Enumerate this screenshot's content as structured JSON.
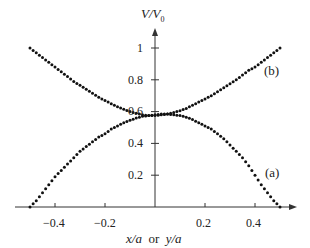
{
  "chart_data": {
    "type": "scatter",
    "title": "",
    "xlabel": "x/a  or  y/a",
    "ylabel": "V/V0",
    "xlim": [
      -0.5,
      0.5
    ],
    "ylim": [
      0,
      1.05
    ],
    "grid": false,
    "legend": "inline labels (a) and (b)",
    "x_ticks": [
      "-0.4",
      "-0.2",
      "0.2",
      "0.4"
    ],
    "y_ticks": [
      "0.2",
      "0.4",
      "0.6",
      "0.8",
      "1"
    ],
    "x": [
      -0.5,
      -0.475,
      -0.45,
      -0.425,
      -0.4,
      -0.375,
      -0.35,
      -0.325,
      -0.3,
      -0.275,
      -0.25,
      -0.225,
      -0.2,
      -0.175,
      -0.15,
      -0.125,
      -0.1,
      -0.075,
      -0.05,
      -0.025,
      0,
      0.025,
      0.05,
      0.075,
      0.1,
      0.125,
      0.15,
      0.175,
      0.2,
      0.225,
      0.25,
      0.275,
      0.3,
      0.325,
      0.35,
      0.375,
      0.4,
      0.425,
      0.45,
      0.475,
      0.5
    ],
    "series": [
      {
        "name": "(a)",
        "values": [
          0.0,
          0.04,
          0.09,
          0.14,
          0.19,
          0.23,
          0.27,
          0.31,
          0.35,
          0.38,
          0.41,
          0.44,
          0.46,
          0.49,
          0.51,
          0.53,
          0.545,
          0.56,
          0.57,
          0.575,
          0.58,
          0.585,
          0.585,
          0.58,
          0.575,
          0.565,
          0.55,
          0.53,
          0.51,
          0.49,
          0.46,
          0.43,
          0.39,
          0.35,
          0.31,
          0.26,
          0.2,
          0.14,
          0.09,
          0.04,
          0.0
        ]
      },
      {
        "name": "(b)",
        "values": [
          1.0,
          0.97,
          0.94,
          0.91,
          0.88,
          0.85,
          0.82,
          0.79,
          0.765,
          0.74,
          0.715,
          0.69,
          0.67,
          0.65,
          0.63,
          0.615,
          0.6,
          0.59,
          0.58,
          0.575,
          0.575,
          0.58,
          0.585,
          0.595,
          0.605,
          0.62,
          0.64,
          0.66,
          0.68,
          0.7,
          0.725,
          0.75,
          0.775,
          0.8,
          0.83,
          0.86,
          0.88,
          0.91,
          0.94,
          0.97,
          1.0
        ]
      }
    ],
    "annotations": [
      {
        "text": "(a)",
        "x": 0.44,
        "y": 0.2
      },
      {
        "text": "(b)",
        "x": 0.44,
        "y": 0.8
      }
    ]
  },
  "labels": {
    "ylabel_main": "V/V",
    "ylabel_sub": "0",
    "xlabel_x": "x/a",
    "xlabel_or": "or",
    "xlabel_y": "y/a",
    "series_a": "(a)",
    "series_b": "(b)",
    "xt": [
      "−0.4",
      "−0.2",
      "0.2",
      "0.4"
    ],
    "yt": [
      "0.2",
      "0.4",
      "0.6",
      "0.8",
      "1"
    ]
  }
}
